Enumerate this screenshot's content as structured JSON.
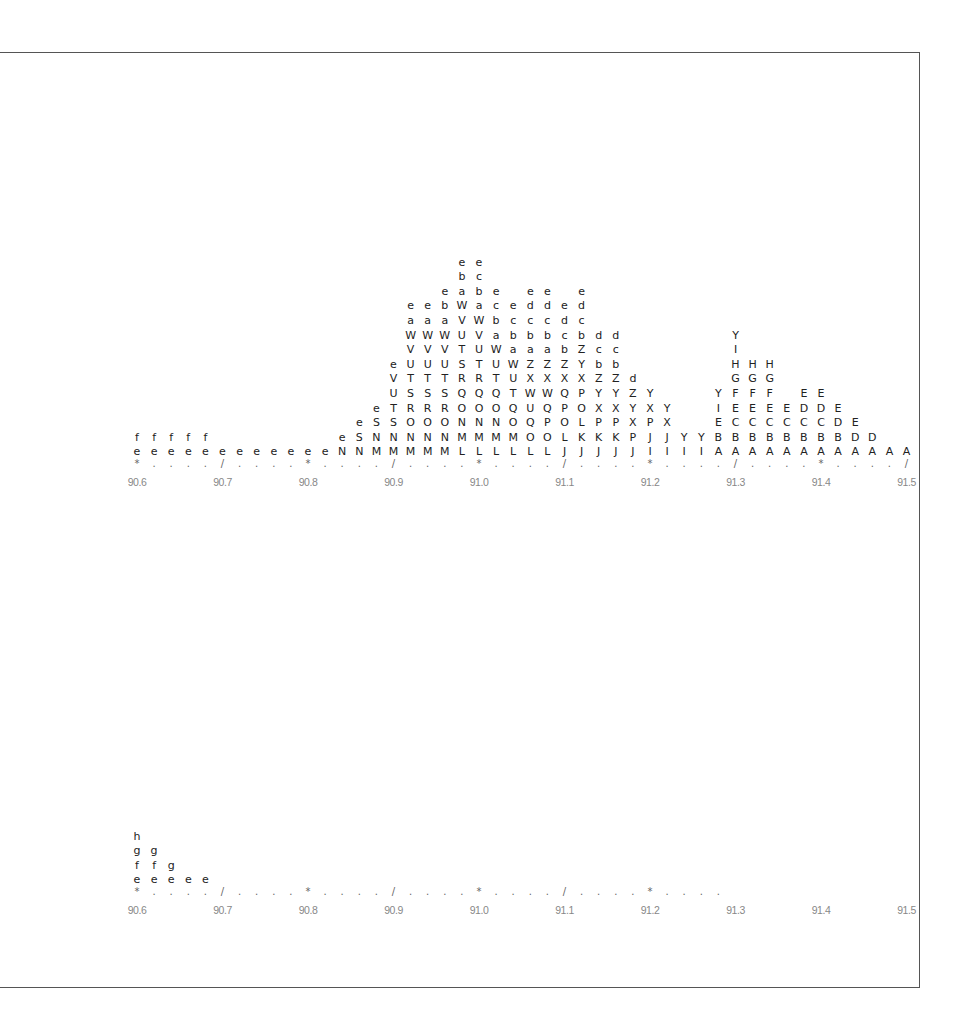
{
  "chart_data": [
    {
      "type": "stem-and-leaf-histogram",
      "title": "",
      "xlabel": "",
      "ylabel": "",
      "x_start": 90.6,
      "x_step": 0.02,
      "xlim": [
        90.6,
        91.5
      ],
      "tick_labels": [
        "90.6",
        "90.7",
        "90.8",
        "90.9",
        "91.0",
        "91.1",
        "91.2",
        "91.3",
        "91.4",
        "91.5"
      ],
      "axis_marks": [
        "*",
        ".",
        ".",
        ".",
        ".",
        "/",
        ".",
        ".",
        ".",
        ".",
        "*",
        ".",
        ".",
        ".",
        ".",
        "/",
        ".",
        ".",
        ".",
        ".",
        "*",
        ".",
        ".",
        ".",
        ".",
        "/",
        ".",
        ".",
        ".",
        ".",
        "*",
        ".",
        ".",
        ".",
        ".",
        "/",
        ".",
        ".",
        ".",
        ".",
        "*",
        ".",
        ".",
        ".",
        ".",
        "/"
      ],
      "columns": [
        "ef",
        "ef",
        "ef",
        "ef",
        "ef",
        "e",
        "e",
        "e",
        "e",
        "e",
        "e",
        "e",
        "Ne",
        "NSe",
        "MNSe",
        "MNSTUVe",
        "MNORSTUVWae",
        "MNORSTUVWae",
        "MNORSTUVWabe",
        "LMNOQRSTUVWabe",
        "LMNOQRTUVWabce",
        "LMNOQTUWabce",
        "LMOQTUWabce",
        "LOQUWXZabcde",
        "LOPQWXZabcde",
        "JLOPQXZbcde",
        "JKLOPXYZbcde",
        "JKPXYZbcd",
        "JKPXYZbcd",
        "JPXYZd",
        "IJPXY",
        "IJXY",
        "IY",
        "IY",
        "ABEIY",
        "ABCEFGHIY",
        "ABCEFGH",
        "ABCEFGH",
        "ABCE",
        "ABCDE",
        "ABCDE",
        "ABDE",
        "ADE",
        "AD",
        "A",
        "A"
      ]
    },
    {
      "type": "stem-and-leaf-histogram",
      "title": "",
      "xlabel": "",
      "ylabel": "",
      "x_start": 90.6,
      "x_step": 0.02,
      "xlim": [
        90.6,
        91.5
      ],
      "tick_labels": [
        "90.6",
        "90.7",
        "90.8",
        "90.9",
        "91.0",
        "91.1",
        "91.2",
        "91.3",
        "91.4",
        "91.5"
      ],
      "axis_marks": [
        "*",
        ".",
        ".",
        ".",
        ".",
        "/",
        ".",
        ".",
        ".",
        ".",
        "*",
        ".",
        ".",
        ".",
        ".",
        "/",
        ".",
        ".",
        ".",
        ".",
        "*",
        ".",
        ".",
        ".",
        ".",
        "/",
        ".",
        ".",
        ".",
        ".",
        "*",
        ".",
        ".",
        ".",
        "."
      ],
      "columns": [
        "efgh",
        "efg",
        "eg",
        "e",
        "e"
      ]
    }
  ]
}
